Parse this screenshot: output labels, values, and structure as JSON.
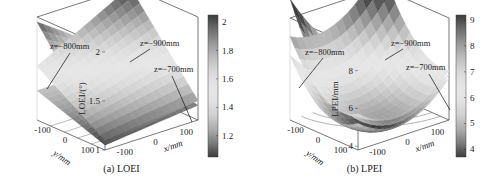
{
  "chart_data": [
    {
      "id": "a",
      "type": "surface3d",
      "caption": "(a) LOEI",
      "zlabel": "LOEI/(°)",
      "xlabel": "x/mm",
      "ylabel": "y/mm",
      "xticks": [
        "-100",
        "0",
        "100"
      ],
      "yticks": [
        "100",
        "0",
        "-100"
      ],
      "zticks": [
        "1",
        "1.5",
        "2"
      ],
      "zlim": [
        1,
        2.05
      ],
      "xlim": [
        -150,
        150
      ],
      "ylim": [
        -150,
        150
      ],
      "colorbar": {
        "ticks": [
          "2",
          "1.8",
          "1.6",
          "1.4",
          "1.2"
        ],
        "range": [
          1.05,
          2.05
        ]
      },
      "series": [
        {
          "name": "z=-800mm",
          "label": "z=−800mm",
          "corner_values": {
            "xmin_ymax": 2.0,
            "xmax_ymax": 1.35,
            "xmin_ymin": 1.05,
            "xmax_ymin": 1.2
          }
        },
        {
          "name": "z=-900mm",
          "label": "z=−900mm",
          "corner_values": {
            "xmin_ymax": 1.55,
            "xmax_ymax": 2.05,
            "xmin_ymin": 1.1,
            "xmax_ymin": 1.2
          }
        },
        {
          "name": "z=-700mm",
          "label": "z=−700mm",
          "corner_values": {
            "xmin_ymax": 1.3,
            "xmax_ymax": 1.3,
            "xmin_ymin": 1.05,
            "xmax_ymin": 1.15
          }
        }
      ]
    },
    {
      "id": "b",
      "type": "surface3d",
      "caption": "(b) LPEI",
      "zlabel": "LPEI/mm",
      "xlabel": "x/mm",
      "ylabel": "y/mm",
      "xticks": [
        "-100",
        "0",
        "100"
      ],
      "yticks": [
        "100",
        "0",
        "-100"
      ],
      "zticks": [
        "4",
        "6",
        "8"
      ],
      "zlim": [
        3.8,
        9.2
      ],
      "xlim": [
        -150,
        150
      ],
      "ylim": [
        -150,
        150
      ],
      "colorbar": {
        "ticks": [
          "9",
          "8",
          "7",
          "6",
          "5",
          "4"
        ],
        "range": [
          3.7,
          9.2
        ]
      },
      "series": [
        {
          "name": "z=-800mm",
          "label": "z=−800mm",
          "corner_values": {
            "xmin_ymax": 9.0,
            "xmax_ymax": 5.0,
            "xmin_ymin": 4.2,
            "xmax_ymin": 5.0
          }
        },
        {
          "name": "z=-900mm",
          "label": "z=−900mm",
          "corner_values": {
            "xmin_ymax": 7.0,
            "xmax_ymax": 9.2,
            "xmin_ymin": 4.5,
            "xmax_ymin": 5.2
          }
        },
        {
          "name": "z=-700mm",
          "label": "z=−700mm",
          "corner_values": {
            "xmin_ymax": 6.0,
            "xmax_ymax": 5.0,
            "xmin_ymin": 4.0,
            "xmax_ymin": 4.8
          }
        }
      ]
    }
  ]
}
